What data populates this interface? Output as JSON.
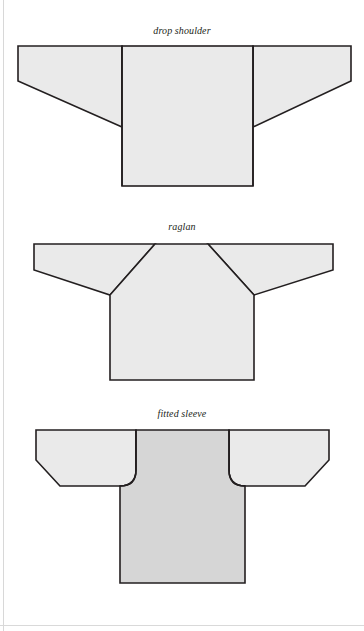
{
  "page": {
    "background_color": "#ffffff",
    "width": 364,
    "height": 631,
    "margin_rule_color": "#d8d8d8",
    "footer_rule_color": "#d9d9d9"
  },
  "style": {
    "outline_color": "#231f20",
    "fill_color": "#eaeaea",
    "fill_color_deep": "#d6d6d6",
    "stroke_width": 1.6
  },
  "figures": [
    {
      "id": "drop-shoulder",
      "caption": "drop shoulder",
      "caption_top": 25,
      "svg_top": 40,
      "svg_height": 165,
      "silhouette_type": "drop shoulder sweater schematic",
      "description": "Straight rectangular body with wide rectangular sleeves angling down to narrow cuffs; shoulder seam drops past the natural shoulder line.",
      "geometry": {
        "body": {
          "left": 122,
          "right": 253,
          "top": 46,
          "bottom": 186
        },
        "left_sleeve": {
          "cuff_x": 18,
          "top_y": 46,
          "cuff_bottom_y": 81,
          "underarm_x": 122,
          "underarm_y": 127
        },
        "right_sleeve": {
          "cuff_x": 351,
          "top_y": 46,
          "cuff_bottom_y": 81,
          "underarm_x": 253,
          "underarm_y": 127
        }
      }
    },
    {
      "id": "raglan",
      "caption": "raglan",
      "caption_top": 221,
      "svg_top": 236,
      "svg_height": 152,
      "silhouette_type": "raglan sleeve sweater schematic",
      "description": "Body with diagonal raglan seams running from the underarm up to the neckline; sleeves taper from shoulder to cuff.",
      "geometry": {
        "body": {
          "left": 110,
          "right": 254,
          "bottom": 380,
          "underarm_y": 295
        },
        "neck": {
          "left_x": 155,
          "right_x": 208,
          "top_y": 244
        },
        "left_sleeve": {
          "cuff_x": 34,
          "top_y": 244,
          "cuff_bottom_y": 270
        },
        "right_sleeve": {
          "cuff_x": 333,
          "top_y": 244,
          "cuff_bottom_y": 270
        }
      }
    },
    {
      "id": "fitted-sleeve",
      "caption": "fitted sleeve",
      "caption_top": 408,
      "svg_top": 424,
      "svg_height": 166,
      "silhouette_type": "fitted (set-in) sleeve sweater schematic",
      "description": "Set-in sleeve construction with curved armhole seams; the body is a deeper shade than the sleeves and the sleeves angle down to narrow cuffs.",
      "geometry": {
        "body": {
          "left": 120,
          "right": 245,
          "top": 430,
          "bottom": 583,
          "armhole_curve_top_y": 430,
          "armhole_curve_bottom_y": 486
        },
        "left_sleeve": {
          "cuff_x": 36,
          "top_y": 430,
          "cuff_bottom_y": 486
        },
        "right_sleeve": {
          "cuff_x": 329,
          "top_y": 430,
          "cuff_bottom_y": 486
        }
      }
    }
  ]
}
